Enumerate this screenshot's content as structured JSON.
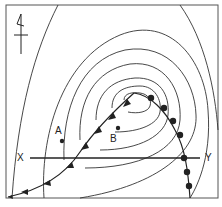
{
  "map": {
    "type": "weather-map",
    "labels": {
      "x": "X",
      "y": "Y",
      "point_a": "A",
      "point_b": "B"
    },
    "features": {
      "low_pressure_center": "center of concentric isobars",
      "cold_front": "line with triangles extending southwest from low",
      "warm_front": "line with semicircles extending southeast from low",
      "cross_section_line": "X to Y",
      "north_arrow": "upper-left"
    },
    "colors": {
      "line": "#222222",
      "background": "#ffffff"
    }
  }
}
